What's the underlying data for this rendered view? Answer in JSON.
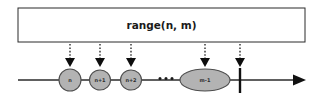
{
  "figure": {
    "type": "diagram",
    "width": 323,
    "height": 101,
    "background_color": "#ffffff"
  },
  "range_box": {
    "label": "range(n, m)",
    "x": 18,
    "y": 8,
    "width": 287,
    "height": 34,
    "fill_color": "#ffffff",
    "stroke_color": "#2b2b2b"
  },
  "number_line": {
    "start_x": 18,
    "end_x": 305,
    "y": 80,
    "stroke_color": "#2b2b2b",
    "arrowhead": "right"
  },
  "nodes": [
    {
      "label": "n",
      "cx": 70,
      "cy": 80,
      "rx": 11,
      "ry": 11,
      "shape": "circle"
    },
    {
      "label": "n+1",
      "cx": 100,
      "cy": 80,
      "rx": 10.5,
      "ry": 10,
      "shape": "circle"
    },
    {
      "label": "n+2",
      "cx": 131,
      "cy": 80,
      "rx": 10.5,
      "ry": 10,
      "shape": "circle"
    },
    {
      "label": "m-1",
      "cx": 205,
      "cy": 80,
      "rx": 25,
      "ry": 11,
      "shape": "ellipse"
    }
  ],
  "node_style": {
    "fill_color": "#b3b3b3",
    "stroke_color": "#4d4d4d",
    "label_color": "#2e2e2e"
  },
  "ellipsis": {
    "label": "...",
    "cx": 166,
    "cy": 79,
    "dot_positions": [
      160,
      166,
      172
    ],
    "color": "#1a1a1a"
  },
  "pointer_arrows": [
    {
      "target": "n",
      "x": 70,
      "top_y": 44,
      "tip_y": 66
    },
    {
      "target": "n+1",
      "x": 100,
      "top_y": 44,
      "tip_y": 66
    },
    {
      "target": "n+2",
      "x": 131,
      "top_y": 44,
      "tip_y": 66
    },
    {
      "target": "m-1",
      "x": 205,
      "top_y": 44,
      "tip_y": 66
    },
    {
      "target": "end-tick",
      "x": 240,
      "top_y": 44,
      "tip_y": 66
    }
  ],
  "pointer_style": {
    "line_style": "dotted",
    "color": "#1c1c1c",
    "arrowhead": "down"
  },
  "end_marker": {
    "name": "m",
    "x": 240,
    "y_top": 68,
    "y_bottom": 93,
    "color": "#111111"
  }
}
